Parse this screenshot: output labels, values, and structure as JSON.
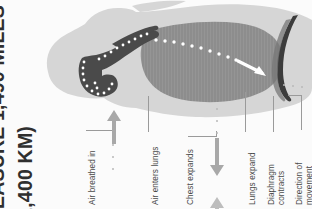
{
  "page": {
    "width": 312,
    "height": 209,
    "background": "#fbfbfb"
  },
  "headline": {
    "line1": "MEASURE 1,490 MILES",
    "line2": "(2,400 KM)",
    "color": "#2f2f2f",
    "orientation": "rotated-90-ccw"
  },
  "figure": {
    "name": "respiratory-system-inhalation-diagram",
    "colors": {
      "body_silhouette": "#d6d6d6",
      "lung": "#8d8d8d",
      "airway": "#4a4a4a",
      "diaphragm": "#3c3c3c",
      "airflow_dots": "#ffffff",
      "airflow_arrow": "#ffffff",
      "leader_line": "#9a9a9a",
      "motion_arrow": "#a8a8a8"
    },
    "parts": [
      {
        "id": "body-silhouette",
        "label": "Body silhouette (head, neck and chest in profile)"
      },
      {
        "id": "airway",
        "label": "Nasal cavity, throat and trachea"
      },
      {
        "id": "lung",
        "label": "Lung"
      },
      {
        "id": "diaphragm",
        "label": "Diaphragm"
      },
      {
        "id": "airflow-path",
        "label": "Dotted path of air travelling into the lung"
      },
      {
        "id": "airflow-arrow",
        "label": "White arrow showing air entering the lung"
      }
    ]
  },
  "callouts": [
    {
      "id": "air-breathed-in",
      "text": "Air breathed in"
    },
    {
      "id": "air-enters-lungs",
      "text": "Air enters lungs"
    },
    {
      "id": "chest-expands",
      "text": "Chest expands"
    },
    {
      "id": "lungs-expand",
      "text": "Lungs expand"
    },
    {
      "id": "diaphragm-contracts-1",
      "text": "Diaphragm"
    },
    {
      "id": "diaphragm-contracts-2",
      "text": "contracts"
    },
    {
      "id": "direction-of-movement-1",
      "text": "Direction of"
    },
    {
      "id": "direction-of-movement-2",
      "text": "movement"
    }
  ],
  "indicators": {
    "air_in_arrow": "up-arrow",
    "chest_expand_arrow": "down-arrow",
    "chest_expand_arrow_secondary": "up-arrow"
  }
}
